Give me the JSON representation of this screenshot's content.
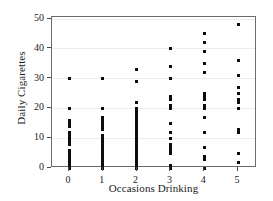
{
  "chart_data": {
    "type": "scatter",
    "title": "",
    "xlabel": "Occasions Drinking",
    "ylabel": "Daily Cigarettes",
    "xlim": [
      -0.55,
      5.6
    ],
    "ylim": [
      -1.5,
      50.5
    ],
    "xticks": [
      0,
      1,
      2,
      3,
      4,
      5
    ],
    "xticklabels": [
      "0",
      "1",
      "2",
      "3",
      "4",
      "5"
    ],
    "yticks": [
      0,
      10,
      20,
      30,
      40,
      50
    ],
    "yticklabels": [
      "0",
      "10",
      "20",
      "30",
      "40",
      "50"
    ],
    "grid": "horizontal",
    "legend": "none",
    "marker": "square",
    "marker_color": "#0d0d0d",
    "frame_color": "#6b6b6b",
    "grid_color": "#ececec",
    "series": [
      {
        "name": "Students",
        "points": [
          [
            0,
            0
          ],
          [
            0,
            1
          ],
          [
            0,
            2
          ],
          [
            0,
            3
          ],
          [
            0,
            4
          ],
          [
            0,
            5
          ],
          [
            0,
            6
          ],
          [
            0,
            8
          ],
          [
            0,
            9
          ],
          [
            0,
            10
          ],
          [
            0,
            11
          ],
          [
            0,
            12
          ],
          [
            0,
            14
          ],
          [
            0,
            15
          ],
          [
            0,
            16
          ],
          [
            0,
            20
          ],
          [
            0,
            30
          ],
          [
            1,
            0
          ],
          [
            1,
            1
          ],
          [
            1,
            2
          ],
          [
            1,
            3
          ],
          [
            1,
            4
          ],
          [
            1,
            5
          ],
          [
            1,
            6
          ],
          [
            1,
            7
          ],
          [
            1,
            8
          ],
          [
            1,
            9
          ],
          [
            1,
            10
          ],
          [
            1,
            11
          ],
          [
            1,
            13
          ],
          [
            1,
            14
          ],
          [
            1,
            15
          ],
          [
            1,
            16
          ],
          [
            1,
            17
          ],
          [
            1,
            20
          ],
          [
            1,
            30
          ],
          [
            2,
            0
          ],
          [
            2,
            1
          ],
          [
            2,
            2
          ],
          [
            2,
            3
          ],
          [
            2,
            4
          ],
          [
            2,
            5
          ],
          [
            2,
            6
          ],
          [
            2,
            7
          ],
          [
            2,
            8
          ],
          [
            2,
            9
          ],
          [
            2,
            10
          ],
          [
            2,
            11
          ],
          [
            2,
            12
          ],
          [
            2,
            13
          ],
          [
            2,
            14
          ],
          [
            2,
            15
          ],
          [
            2,
            16
          ],
          [
            2,
            17
          ],
          [
            2,
            18
          ],
          [
            2,
            19
          ],
          [
            2,
            20
          ],
          [
            2,
            22
          ],
          [
            2,
            29
          ],
          [
            2,
            33
          ],
          [
            3,
            0
          ],
          [
            3,
            1
          ],
          [
            3,
            5
          ],
          [
            3,
            6
          ],
          [
            3,
            7
          ],
          [
            3,
            8
          ],
          [
            3,
            10
          ],
          [
            3,
            12
          ],
          [
            3,
            15
          ],
          [
            3,
            20
          ],
          [
            3,
            21
          ],
          [
            3,
            23
          ],
          [
            3,
            24
          ],
          [
            3,
            30
          ],
          [
            3,
            34
          ],
          [
            3,
            40
          ],
          [
            4,
            0
          ],
          [
            4,
            3
          ],
          [
            4,
            4
          ],
          [
            4,
            7
          ],
          [
            4,
            12
          ],
          [
            4,
            17
          ],
          [
            4,
            20
          ],
          [
            4,
            21
          ],
          [
            4,
            23
          ],
          [
            4,
            24
          ],
          [
            4,
            25
          ],
          [
            4,
            32
          ],
          [
            4,
            35
          ],
          [
            4,
            39
          ],
          [
            4,
            42
          ],
          [
            4,
            45
          ],
          [
            5,
            2
          ],
          [
            5,
            5
          ],
          [
            5,
            12
          ],
          [
            5,
            13
          ],
          [
            5,
            20
          ],
          [
            5,
            22
          ],
          [
            5,
            23
          ],
          [
            5,
            25
          ],
          [
            5,
            27
          ],
          [
            5,
            31
          ],
          [
            5,
            36
          ],
          [
            5,
            48
          ]
        ]
      }
    ]
  }
}
